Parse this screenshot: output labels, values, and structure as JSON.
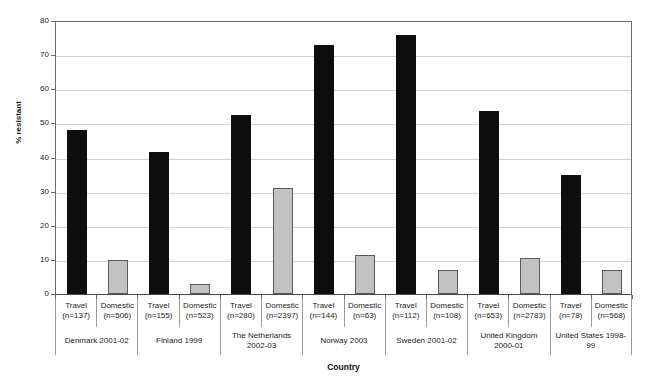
{
  "chart_data": {
    "type": "bar",
    "title": "",
    "xlabel": "Country",
    "ylabel": "% resistant",
    "ylim": [
      0,
      80
    ],
    "ytick_step": 10,
    "yticks": [
      0,
      10,
      20,
      30,
      40,
      50,
      60,
      70,
      80
    ],
    "grid": true,
    "legend": "none",
    "categories": [
      "Denmark 2001-02",
      "Finland 1999",
      "The Netherlands 2002-03",
      "Norway 2003",
      "Sweden 2001-02",
      "United Kingdom 2000-01",
      "United States 1998-99"
    ],
    "series": [
      {
        "name": "Travel",
        "values": [
          48.0,
          41.5,
          52.5,
          73.0,
          76.0,
          53.5,
          35.0
        ]
      },
      {
        "name": "Domestic",
        "values": [
          10.0,
          3.0,
          31.0,
          11.5,
          7.0,
          10.5,
          7.0
        ]
      }
    ],
    "sample_sizes": {
      "Travel": [
        "(n=137)",
        "(n=155)",
        "(n=280)",
        "(n=144)",
        "(n=112)",
        "(n=653)",
        "(n=78)"
      ],
      "Domestic": [
        "(n=506)",
        "(n=523)",
        "(n=2397)",
        "(n=63)",
        "(n=108)",
        "(n=2783)",
        "(n=568)"
      ]
    },
    "colors": {
      "travel": "#0d0d0d",
      "domestic": "#c2c2c2",
      "domestic_border": "#5a5a5a",
      "gridline": "#d2d2d2",
      "axis": "#6b6b6b",
      "background": "#ffffff"
    }
  },
  "axis": {
    "ytitle": "% resistant",
    "xtitle": "Country",
    "ytick_labels": [
      "80",
      "70",
      "60",
      "50",
      "40",
      "30",
      "20",
      "10",
      "0"
    ]
  },
  "groups": [
    {
      "label": "Denmark 2001-02",
      "series": [
        {
          "name": "Travel",
          "n": "(n=137)",
          "value": 48.0
        },
        {
          "name": "Domestic",
          "n": "(n=506)",
          "value": 10.0
        }
      ]
    },
    {
      "label": "Finland 1999",
      "series": [
        {
          "name": "Travel",
          "n": "(n=155)",
          "value": 41.5
        },
        {
          "name": "Domestic",
          "n": "(n=523)",
          "value": 3.0
        }
      ]
    },
    {
      "label": "The Netherlands 2002-03",
      "series": [
        {
          "name": "Travel",
          "n": "(n=280)",
          "value": 52.5
        },
        {
          "name": "Domestic",
          "n": "(n=2397)",
          "value": 31.0
        }
      ]
    },
    {
      "label": "Norway 2003",
      "series": [
        {
          "name": "Travel",
          "n": "(n=144)",
          "value": 73.0
        },
        {
          "name": "Domestic",
          "n": "(n=63)",
          "value": 11.5
        }
      ]
    },
    {
      "label": "Sweden 2001-02",
      "series": [
        {
          "name": "Travel",
          "n": "(n=112)",
          "value": 76.0
        },
        {
          "name": "Domestic",
          "n": "(n=108)",
          "value": 7.0
        }
      ]
    },
    {
      "label": "United Kingdom 2000-01",
      "series": [
        {
          "name": "Travel",
          "n": "(n=653)",
          "value": 53.5
        },
        {
          "name": "Domestic",
          "n": "(n=2783)",
          "value": 10.5
        }
      ]
    },
    {
      "label": "United States 1998-99",
      "series": [
        {
          "name": "Travel",
          "n": "(n=78)",
          "value": 35.0
        },
        {
          "name": "Domestic",
          "n": "(n=568)",
          "value": 7.0
        }
      ]
    }
  ]
}
